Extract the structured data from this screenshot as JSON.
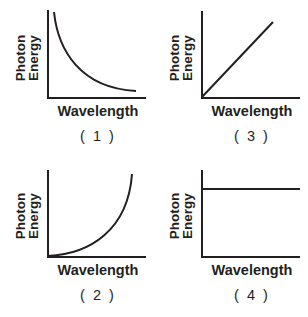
{
  "panels": [
    {
      "id": "1",
      "number_label": "( 1 )",
      "ylabel_line1": "Photon",
      "ylabel_line2": "Energy",
      "xlabel": "Wavelength",
      "shape": "decreasing-curve"
    },
    {
      "id": "3",
      "number_label": "( 3 )",
      "ylabel_line1": "Photon",
      "ylabel_line2": "Energy",
      "xlabel": "Wavelength",
      "shape": "increasing-line"
    },
    {
      "id": "2",
      "number_label": "( 2 )",
      "ylabel_line1": "Photon",
      "ylabel_line2": "Energy",
      "xlabel": "Wavelength",
      "shape": "increasing-curve"
    },
    {
      "id": "4",
      "number_label": "( 4 )",
      "ylabel_line1": "Photon",
      "ylabel_line2": "Energy",
      "xlabel": "Wavelength",
      "shape": "constant-line"
    }
  ],
  "colors": {
    "ink": "#231f20",
    "background": "#ffffff"
  }
}
